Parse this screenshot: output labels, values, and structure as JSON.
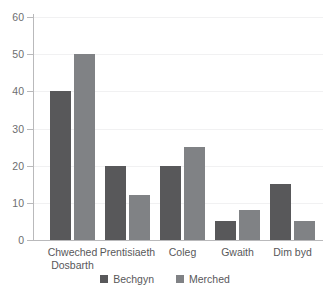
{
  "chart_data": {
    "type": "bar",
    "title": "",
    "subtitle": "",
    "xlabel": "",
    "ylabel": "",
    "ylim": [
      0,
      60
    ],
    "ytick_labels": [
      "0",
      "10",
      "20",
      "30",
      "40",
      "50",
      "60"
    ],
    "yticks": [
      0,
      10,
      20,
      30,
      40,
      50,
      60
    ],
    "grid": true,
    "grid_axis": "y",
    "legend_position": "bottom-center",
    "categories": [
      "Chweched Dosbarth",
      "Prentisiaeth",
      "Coleg",
      "Gwaith",
      "Dim byd"
    ],
    "category_lines": [
      [
        "Chweched",
        "Dosbarth"
      ],
      [
        "Prentisiaeth"
      ],
      [
        "Coleg"
      ],
      [
        "Gwaith"
      ],
      [
        "Dim byd"
      ]
    ],
    "series": [
      {
        "name": "Bechgyn",
        "color": "#58585a",
        "values": [
          40,
          20,
          20,
          5,
          15
        ]
      },
      {
        "name": "Merched",
        "color": "#808285",
        "values": [
          50,
          12,
          25,
          8,
          5
        ]
      }
    ]
  },
  "legend": {
    "items": [
      {
        "label": "Bechgyn",
        "swatch": "legend-swatch-bechgyn"
      },
      {
        "label": "Merched",
        "swatch": "legend-swatch-merched"
      }
    ]
  },
  "colors": {
    "series_bechgyn": "#58585a",
    "series_merched": "#808285",
    "axis": "#b9b9bb",
    "gridline": "#f1f1f2",
    "tick_text": "#6d6e70",
    "label_text": "#58585a",
    "background": "#ffffff"
  }
}
